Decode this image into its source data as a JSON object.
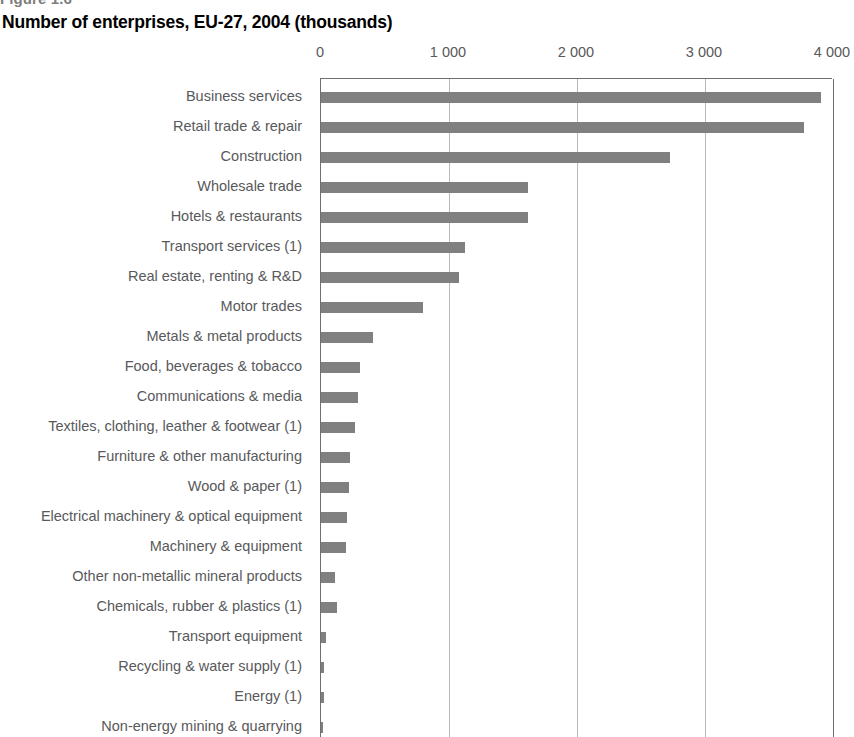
{
  "figure": {
    "label": "Figure 1.6"
  },
  "title": "Number of enterprises, EU-27, 2004 (thousands)",
  "axis": {
    "ticks": [
      "0",
      "1 000",
      "2 000",
      "3 000",
      "4 000"
    ]
  },
  "colors": {
    "bar": "#808080",
    "gridline": "#b9b9b9",
    "axis": "#6f6f6f",
    "label_text": "#58595b",
    "title_text": "#000000",
    "figure_label_text": "#7d7d7d"
  },
  "chart_data": {
    "type": "bar",
    "orientation": "horizontal",
    "title": "Number of enterprises, EU-27, 2004 (thousands)",
    "xlabel": "",
    "ylabel": "",
    "xlim": [
      0,
      4000
    ],
    "xticks": [
      0,
      1000,
      2000,
      3000,
      4000
    ],
    "xtick_labels": [
      "0",
      "1 000",
      "2 000",
      "3 000",
      "4 000"
    ],
    "grid": true,
    "legend": false,
    "units": "thousands",
    "categories": [
      "Business services",
      "Retail trade & repair",
      "Construction",
      "Wholesale trade",
      "Hotels & restaurants",
      "Transport services (1)",
      "Real estate, renting & R&D",
      "Motor trades",
      "Metals & metal products",
      "Food, beverages & tobacco",
      "Communications & media",
      "Textiles, clothing, leather & footwear (1)",
      "Furniture & other manufacturing",
      "Wood & paper (1)",
      "Electrical machinery & optical equipment",
      "Machinery & equipment",
      "Other non-metallic mineral products",
      "Chemicals, rubber & plastics (1)",
      "Transport equipment",
      "Recycling & water supply (1)",
      "Energy (1)",
      "Non-energy mining & quarrying"
    ],
    "values": [
      3910,
      3770,
      2730,
      1620,
      1615,
      1125,
      1080,
      800,
      405,
      305,
      290,
      265,
      230,
      220,
      205,
      195,
      110,
      125,
      40,
      25,
      22,
      18
    ]
  }
}
